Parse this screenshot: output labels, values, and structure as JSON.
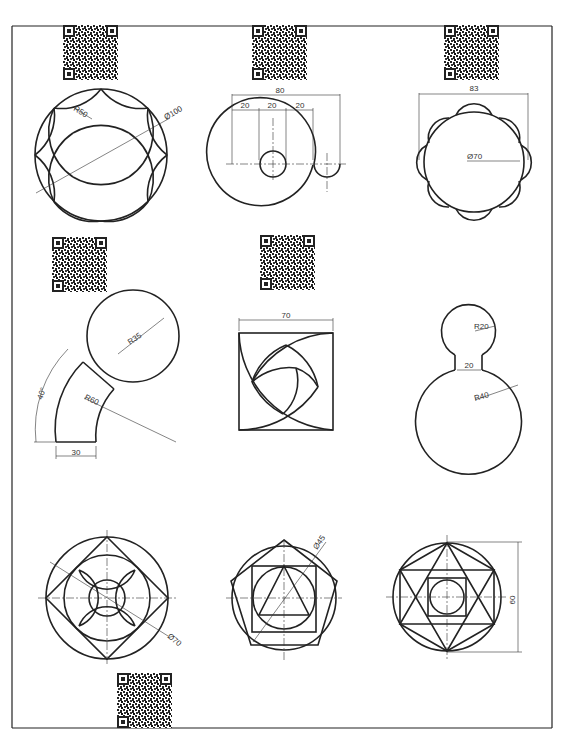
{
  "sheet": {
    "border_color": "#222222",
    "line_color": "#222222",
    "background": "#ffffff"
  },
  "figures": [
    {
      "id": "fig1",
      "description": "Circle with eight arc star pattern",
      "labels": {
        "radius": "R50",
        "diameter": "Ø100"
      }
    },
    {
      "id": "fig2",
      "description": "Circle with small hole and semicircular notch",
      "labels": {
        "overall": "80",
        "seg1": "20",
        "seg2": "20",
        "seg3": "20"
      }
    },
    {
      "id": "fig3",
      "description": "Circle with scalloped outer petals",
      "labels": {
        "width": "83",
        "diameter": "Ø70"
      }
    },
    {
      "id": "fig4",
      "description": "Curved arm joined to circle",
      "labels": {
        "circle_radius": "R35",
        "arc_radius": "R60",
        "angle": "40°",
        "width": "30"
      }
    },
    {
      "id": "fig5",
      "description": "Square with swirling arc pattern",
      "labels": {
        "width": "70"
      }
    },
    {
      "id": "fig6",
      "description": "Small circle on top of large circle with neck",
      "labels": {
        "small_radius": "R20",
        "neck": "20",
        "large_radius": "R40"
      }
    },
    {
      "id": "fig7",
      "description": "Nested circle, rotated square and concave arcs",
      "labels": {
        "diameter": "Ø70"
      }
    },
    {
      "id": "fig8",
      "description": "Pentagon with inscribed circle, square and triangle",
      "labels": {
        "diameter": "Ø45"
      }
    },
    {
      "id": "fig9",
      "description": "Circle with hexagon, hexagram, square and inner circle",
      "labels": {
        "height": "60"
      }
    }
  ],
  "qr_codes": [
    {
      "id": "qr1",
      "x": 63,
      "y": 25,
      "size": 55
    },
    {
      "id": "qr2",
      "x": 252,
      "y": 25,
      "size": 55
    },
    {
      "id": "qr3",
      "x": 444,
      "y": 25,
      "size": 55
    },
    {
      "id": "qr4",
      "x": 52,
      "y": 237,
      "size": 55
    },
    {
      "id": "qr5",
      "x": 260,
      "y": 235,
      "size": 55
    },
    {
      "id": "qr6",
      "x": 117,
      "y": 673,
      "size": 55
    }
  ]
}
